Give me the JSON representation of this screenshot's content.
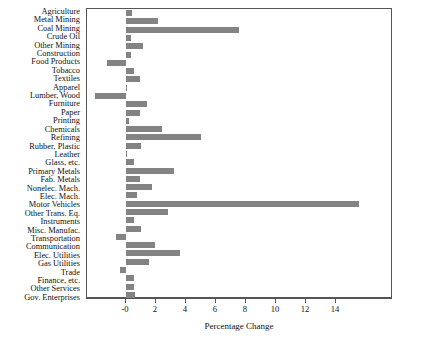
{
  "chart_data": {
    "type": "bar",
    "orientation": "horizontal",
    "title": "",
    "xlabel": "Percentage Change",
    "ylabel": "",
    "xlim": [
      -2.6,
      17.8
    ],
    "xticks": [
      0,
      2,
      4,
      6,
      8,
      10,
      12,
      14
    ],
    "xtick_labels": [
      "-0",
      "2",
      "4",
      "6",
      "8",
      "10",
      "12",
      "14"
    ],
    "grid": false,
    "legend": null,
    "bar_color": "#838383",
    "categories": [
      "Agriculture",
      "Metal Mining",
      "Coal Mining",
      "Crude Oil",
      "Other Mining",
      "Construction",
      "Food Products",
      "Tobacco",
      "Textiles",
      "Apparel",
      "Lumber, Wood",
      "Furniture",
      "Paper",
      "Printing",
      "Chemicals",
      "Refining",
      "Rubber, Plastic",
      "Leather",
      "Glass, etc.",
      "Primary Metals",
      "Fab. Metals",
      "Nonelec. Mach.",
      "Elec. Mach.",
      "Motor Vehicles",
      "Other Trans. Eq.",
      "Instruments",
      "Misc. Manufac.",
      "Transportation",
      "Communication",
      "Elec. Utilities",
      "Gas Utilities",
      "Trade",
      "Finance, etc.",
      "Other Services",
      "Gov. Enterprises"
    ],
    "values": [
      0.4,
      2.1,
      7.5,
      0.3,
      1.1,
      0.3,
      -1.3,
      0.5,
      0.9,
      0.05,
      -2.1,
      1.4,
      0.9,
      0.2,
      2.4,
      5.0,
      1.0,
      0.05,
      0.5,
      3.2,
      0.9,
      1.7,
      0.7,
      15.5,
      2.8,
      0.5,
      1.0,
      -0.7,
      1.9,
      3.6,
      1.5,
      -0.4,
      0.5,
      0.5,
      0.6
    ]
  },
  "axis": {
    "xlabel": "Percentage Change"
  }
}
